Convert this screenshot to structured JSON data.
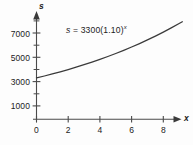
{
  "figure": {
    "annotation": {
      "lhs": "s",
      "equals": "=",
      "coefficient": "3300",
      "base": "(1.10)",
      "exponent": "x",
      "full": "s = 3300(1.10)x"
    },
    "axes": {
      "x_name": "x",
      "y_name": "s",
      "origin_label": "0"
    },
    "line_color": "#3a3a3a",
    "axis_color": "#4a4a4a",
    "text_color": "#222222"
  },
  "chart_data": {
    "type": "line",
    "title": "",
    "subtitle": "",
    "xlabel": "x",
    "ylabel": "s",
    "annotations": [
      "s = 3300(1.10)^x"
    ],
    "grid": false,
    "legend": null,
    "xlim": [
      0,
      9.2
    ],
    "ylim": [
      0,
      8100
    ],
    "xticks": [
      0,
      2,
      4,
      6,
      8
    ],
    "xtick_labels": [
      "0",
      "2",
      "4",
      "6",
      "8"
    ],
    "yticks": [
      1000,
      3000,
      5000,
      7000
    ],
    "ytick_labels": [
      "1000",
      "3000",
      "5000",
      "7000"
    ],
    "y_minor_ticks": [
      2000,
      4000,
      6000,
      8000
    ],
    "series": [
      {
        "name": "s = 3300(1.10)^x",
        "equation": "s = 3300(1.10)^x",
        "x": [
          0,
          0.5,
          1,
          1.5,
          2,
          2.5,
          3,
          3.5,
          4,
          4.5,
          5,
          5.5,
          6,
          6.5,
          7,
          7.5,
          8,
          8.5,
          9,
          9.2
        ],
        "values": [
          3300,
          3461,
          3630,
          3807,
          3993,
          4188,
          4392,
          4606,
          4831,
          5067,
          5314,
          5573,
          5845,
          6131,
          6430,
          6743,
          7073,
          7418,
          7780,
          7930
        ]
      }
    ]
  }
}
